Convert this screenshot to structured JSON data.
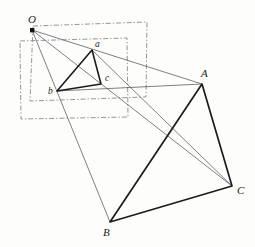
{
  "figure": {
    "width": 255,
    "height": 247,
    "background_color": "#fdfdfc",
    "stroke_color": "#1b1b1b",
    "thin_stroke_color": "#55555a",
    "dash_stroke_color": "#8a8a90"
  },
  "labels": {
    "center": {
      "text": "O",
      "x": 28,
      "y": 14,
      "size": "cap"
    },
    "small_a": {
      "text": "a",
      "x": 95,
      "y": 40,
      "size": "low"
    },
    "small_b": {
      "text": "b",
      "x": 48,
      "y": 87,
      "size": "low"
    },
    "small_c": {
      "text": "c",
      "x": 105,
      "y": 74,
      "size": "low"
    },
    "big_A": {
      "text": "A",
      "x": 201,
      "y": 68,
      "size": "cap"
    },
    "big_B": {
      "text": "B",
      "x": 103,
      "y": 227,
      "size": "cap"
    },
    "big_C": {
      "text": "C",
      "x": 237,
      "y": 185,
      "size": "cap"
    }
  },
  "points": {
    "O": {
      "x": 32,
      "y": 30
    },
    "a": {
      "x": 92,
      "y": 50
    },
    "b": {
      "x": 57,
      "y": 91
    },
    "c": {
      "x": 101,
      "y": 84
    },
    "A": {
      "x": 202,
      "y": 84
    },
    "B": {
      "x": 110,
      "y": 222
    },
    "C": {
      "x": 232,
      "y": 186
    }
  },
  "small_triangle": {
    "name": "triangle-abc",
    "vertices": [
      "a",
      "b",
      "c"
    ],
    "path": "M 92,50 L 57,91 L 101,84 Z",
    "stroke_width": 1.6
  },
  "large_triangle": {
    "name": "triangle-ABC",
    "vertices": [
      "A",
      "B",
      "C"
    ],
    "path": "M 202,84 L 110,222 L 232,186 Z",
    "stroke_width": 1.7
  },
  "projection_rays": [
    {
      "name": "ray-O-a-A",
      "from": "O",
      "through": "a",
      "to": "A",
      "path": "M 32,30 L 202,84"
    },
    {
      "name": "ray-O-b-B",
      "from": "O",
      "through": "b",
      "to": "B",
      "path": "M 32,30 L 110,222"
    },
    {
      "name": "ray-O-c-C",
      "from": "O",
      "through": "c",
      "to": "C",
      "path": "M 32,30 L 232,186"
    }
  ],
  "cross_lines": [
    {
      "name": "cross-line-a-C",
      "path": "M 92,50 L 232,186"
    },
    {
      "name": "cross-line-b-A",
      "path": "M 57,91 L 202,84"
    },
    {
      "name": "cross-line-c-A",
      "path": "M 101,84 L 202,84"
    },
    {
      "name": "cross-line-A-B",
      "path": "M 202,84 L 110,222"
    }
  ],
  "dashed_frames": [
    {
      "name": "dashed-frame-upper",
      "path": "M 33,26 L 147,22 L 146,97 L 30,101 Z",
      "dash_pattern": "5,2,1.4,2"
    },
    {
      "name": "dashed-frame-lower",
      "path": "M 20,41 L 127,38 L 128,117 L 21,119 Z",
      "dash_pattern": "5,2,1.4,2"
    }
  ],
  "center_dot": {
    "name": "center-point-O",
    "x": 32,
    "y": 30,
    "size": 4.2
  }
}
